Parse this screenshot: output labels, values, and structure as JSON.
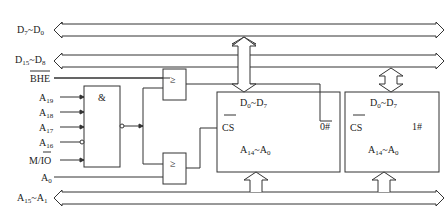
{
  "buses": {
    "d_low": {
      "label_main": "D",
      "sub1": "7",
      "sep": "~D",
      "sub2": "0"
    },
    "d_high": {
      "label_main": "D",
      "sub1": "15",
      "sep": "~D",
      "sub2": "8"
    },
    "addr": {
      "label_main": "A",
      "sub1": "15",
      "sep": "~A",
      "sub2": "1"
    }
  },
  "signals": {
    "bhe": "BHE",
    "a19": {
      "main": "A",
      "sub": "19"
    },
    "a18": {
      "main": "A",
      "sub": "18"
    },
    "a17": {
      "main": "A",
      "sub": "17"
    },
    "a16": {
      "main": "A",
      "sub": "16"
    },
    "mio": {
      "m": "M/",
      "io": "IO"
    },
    "a0": {
      "main": "A",
      "sub": "0"
    }
  },
  "gates": {
    "and": "&",
    "or_top": "≥",
    "or_bottom": "≥"
  },
  "chips": [
    {
      "id": "0#",
      "data": {
        "main": "D",
        "sub1": "0",
        "sep": "~D",
        "sub2": "7"
      },
      "cs": "CS",
      "addr": {
        "main": "A",
        "sub1": "14",
        "sep": "~A",
        "sub2": "0"
      }
    },
    {
      "id": "1#",
      "data": {
        "main": "D",
        "sub1": "0",
        "sep": "~D",
        "sub2": "7"
      },
      "cs": "CS",
      "addr": {
        "main": "A",
        "sub1": "14",
        "sep": "~A",
        "sub2": "0"
      }
    }
  ],
  "colors": {
    "line": "#333333",
    "background": "#ffffff"
  }
}
